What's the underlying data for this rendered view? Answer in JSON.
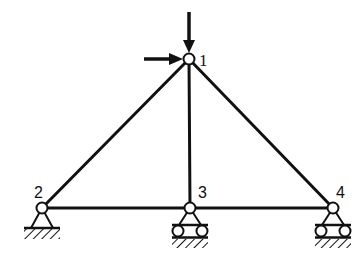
{
  "diagram": {
    "type": "truss",
    "stroke_color": "#111111",
    "background": "#ffffff",
    "nodes": [
      {
        "id": "1",
        "label": "1",
        "x": 189,
        "y": 59
      },
      {
        "id": "2",
        "label": "2",
        "x": 42,
        "y": 208
      },
      {
        "id": "3",
        "label": "3",
        "x": 190,
        "y": 208
      },
      {
        "id": "4",
        "label": "4",
        "x": 333,
        "y": 208
      }
    ],
    "members": [
      {
        "from": "1",
        "to": "2"
      },
      {
        "from": "1",
        "to": "3"
      },
      {
        "from": "1",
        "to": "4"
      },
      {
        "from": "2",
        "to": "3"
      },
      {
        "from": "3",
        "to": "4"
      }
    ],
    "supports": [
      {
        "node": "2",
        "type": "pin"
      },
      {
        "node": "3",
        "type": "roller"
      },
      {
        "node": "4",
        "type": "roller"
      }
    ],
    "loads": [
      {
        "node": "1",
        "direction": "down",
        "description": "vertical-load"
      },
      {
        "node": "1",
        "direction": "right",
        "description": "horizontal-load"
      }
    ]
  }
}
